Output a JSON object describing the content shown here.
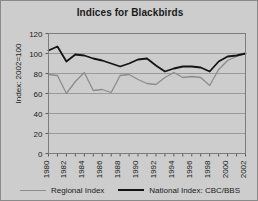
{
  "chart_data": {
    "type": "line",
    "title": "Indices for Blackbirds",
    "xlabel": "",
    "ylabel": "Index: 2002=100",
    "ylim": [
      0,
      120
    ],
    "ytick_step": 20,
    "yticks": [
      0,
      20,
      40,
      60,
      80,
      100,
      120
    ],
    "xlim": [
      1980,
      2002
    ],
    "x": [
      1980,
      1981,
      1982,
      1983,
      1984,
      1985,
      1986,
      1987,
      1988,
      1989,
      1990,
      1991,
      1992,
      1993,
      1994,
      1995,
      1996,
      1997,
      1998,
      1999,
      2000,
      2001,
      2002
    ],
    "xticks_labeled": [
      1980,
      1982,
      1984,
      1986,
      1988,
      1990,
      1992,
      1994,
      1996,
      1998,
      2000,
      2002
    ],
    "grid": true,
    "legend_position": "bottom",
    "series": [
      {
        "name": "Regional Index",
        "color": "#8c8c8c",
        "values": [
          79,
          78,
          60,
          72,
          81,
          63,
          64,
          61,
          78,
          79,
          74,
          70,
          69,
          76,
          81,
          76,
          77,
          76,
          68,
          84,
          93,
          97,
          100
        ]
      },
      {
        "name": "National Index: CBC/BBS",
        "color": "#141414",
        "values": [
          103,
          107,
          92,
          99,
          98,
          95,
          93,
          90,
          87,
          90,
          94,
          95,
          88,
          82,
          85,
          87,
          87,
          86,
          82,
          92,
          97,
          98,
          100
        ]
      }
    ]
  },
  "legend": {
    "regional_label": "Regional Index",
    "national_label": "National Index: CBC/BBS",
    "regional_color": "#8c8c8c",
    "national_color": "#141414"
  }
}
